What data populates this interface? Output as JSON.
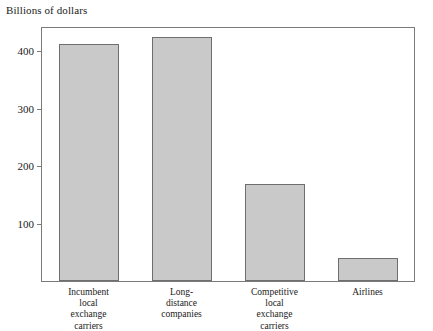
{
  "chart_data": {
    "type": "bar",
    "title": "Billions of dollars",
    "xlabel": "",
    "ylabel": "Billions of dollars",
    "categories": [
      "Incumbent local exchange carriers",
      "Long-distance companies",
      "Competitive local exchange carriers",
      "Airlines"
    ],
    "category_lines": [
      [
        "Incumbent",
        "local",
        "exchange",
        "carriers"
      ],
      [
        "Long-",
        "distance",
        "companies"
      ],
      [
        "Competitive",
        "local",
        "exchange",
        "carriers"
      ],
      [
        "Airlines"
      ]
    ],
    "values": [
      412,
      425,
      168,
      40
    ],
    "ylim": [
      0,
      440
    ],
    "yticks": [
      100,
      200,
      300,
      400
    ],
    "ytick_labels": [
      "100",
      "200",
      "300",
      "400"
    ],
    "grid": false,
    "legend": null,
    "bar_color": "#c9c9c9",
    "bar_border_color": "#6e6e6e",
    "axis_color": "#7a7a7a",
    "text_color": "#1a1a1a"
  }
}
